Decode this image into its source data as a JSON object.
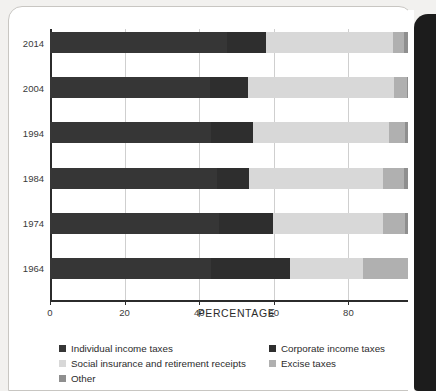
{
  "chart_data": {
    "type": "bar",
    "orientation": "horizontal",
    "stacked": true,
    "stack_mode": "percent",
    "title": "",
    "xlabel": "PERCENTAGE",
    "ylabel": "",
    "xlim": [
      0,
      100
    ],
    "xticks": [
      0,
      20,
      40,
      60,
      80,
      100
    ],
    "xticklabels": [
      "0",
      "20",
      "40",
      "60",
      "80",
      "100"
    ],
    "grid": "vertical",
    "legend_position": "bottom",
    "categories": [
      "2014",
      "2004",
      "1994",
      "1984",
      "1974",
      "1964"
    ],
    "series": [
      {
        "name": "Individual income taxes",
        "color": "#363636",
        "values": [
          47.4,
          43.0,
          43.1,
          44.8,
          45.2,
          43.2
        ]
      },
      {
        "name": "Corporate income taxes",
        "color": "#2e2e2e",
        "values": [
          10.6,
          10.1,
          11.2,
          8.5,
          14.7,
          21.2
        ]
      },
      {
        "name": "Social insurance and retirement receipts",
        "color": "#d8d8d8",
        "values": [
          33.9,
          39.0,
          36.7,
          36.0,
          29.3,
          19.5
        ]
      },
      {
        "name": "Excise taxes",
        "color": "#b0b0b0",
        "values": [
          3.1,
          3.7,
          4.1,
          5.6,
          6.0,
          12.2
        ]
      },
      {
        "name": "Other",
        "color": "#8f8f8f",
        "values": [
          5.0,
          4.2,
          4.9,
          5.1,
          4.8,
          3.9
        ]
      }
    ]
  },
  "legend": {
    "items": [
      {
        "label": "Individual income taxes",
        "color": "#363636",
        "column": 1,
        "row": 1
      },
      {
        "label": "Corporate income taxes",
        "color": "#2e2e2e",
        "column": 2,
        "row": 1
      },
      {
        "label": "Social insurance and retirement receipts",
        "color": "#d8d8d8",
        "column": 1,
        "row": 2
      },
      {
        "label": "Excise taxes",
        "color": "#b0b0b0",
        "column": 2,
        "row": 2
      },
      {
        "label": "Other",
        "color": "#8f8f8f",
        "column": 1,
        "row": 3
      }
    ]
  },
  "axis": {
    "x_title": "PERCENTAGE"
  }
}
